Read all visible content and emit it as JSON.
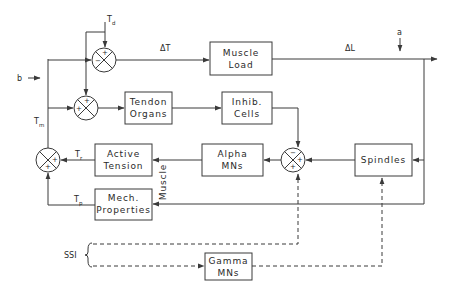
{
  "diagram": {
    "title": "",
    "colors": {
      "line": "#3a3a3a",
      "text": "#2a2a2a",
      "background": "#ffffff"
    },
    "blocks": {
      "muscle_load": {
        "line1": "Muscle",
        "line2": "Load"
      },
      "tendon_organs": {
        "line1": "Tendon",
        "line2": "Organs"
      },
      "inhib_cells": {
        "line1": "Inhib.",
        "line2": "Cells"
      },
      "active_tension": {
        "line1": "Active",
        "line2": "Tension"
      },
      "alpha_mns": {
        "line1": "Alpha",
        "line2": "MNs"
      },
      "spindles": {
        "line1": "Spindles"
      },
      "mech_properties": {
        "line1": "Mech.",
        "line2": "Properties"
      },
      "gamma_mns": {
        "line1": "Gamma",
        "line2": "MNs"
      }
    },
    "group_label": "Muscle",
    "signals": {
      "td": "T",
      "td_sub": "d",
      "delta_t": "ΔT",
      "delta_l": "ΔL",
      "a": "a",
      "b": "b",
      "tm": "T",
      "tm_sub": "m",
      "tr": "T",
      "tr_sub": "r",
      "tp": "T",
      "tp_sub": "p",
      "ssi": "SSI"
    },
    "junctions": {
      "top": {
        "top": "+",
        "left": "−"
      },
      "second": {
        "top": "+",
        "left": "+"
      },
      "left": {
        "right": "+",
        "bottom": "+"
      },
      "right": {
        "top": "−",
        "right": "+",
        "bottom": "+"
      }
    }
  }
}
